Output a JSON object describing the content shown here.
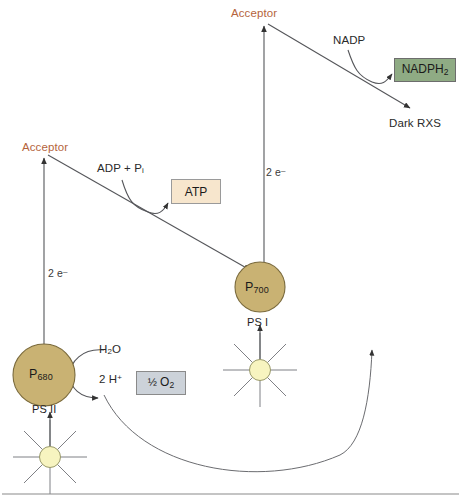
{
  "diagram": {
    "colors": {
      "acceptor_text": "#b5643c",
      "reaction_center_fill": "#c9b273",
      "reaction_center_stroke": "#7a6a3c",
      "atp_box_fill": "#f7e6cd",
      "nadph_box_fill": "#8fab84",
      "o2_box_fill": "#ccd2d9",
      "sun_fill": "#f7f4c0",
      "line": "#55565a",
      "text": "#2a2a2a"
    },
    "labels": {
      "acceptor_left": "Acceptor",
      "acceptor_right": "Acceptor",
      "electrons_left": "2 e",
      "electrons_left_sup": "–",
      "electrons_right": "2 e",
      "electrons_right_sup": "–",
      "adp_pi": "ADP + P",
      "adp_pi_sub": "i",
      "atp": "ATP",
      "nadp": "NADP",
      "nadph2": "NADPH",
      "nadph2_sub": "2",
      "dark_rxs": "Dark RXS",
      "water": "H",
      "water_sub": "2",
      "water_tail": "O",
      "protons": "2 H",
      "protons_sup": "+",
      "oxygen_frac": "½ ",
      "oxygen": "O",
      "oxygen_sub": "2",
      "p680": "P",
      "p680_sub": "680",
      "p700": "P",
      "p700_sub": "700",
      "ps2": "PS II",
      "ps1": "PS I"
    }
  }
}
